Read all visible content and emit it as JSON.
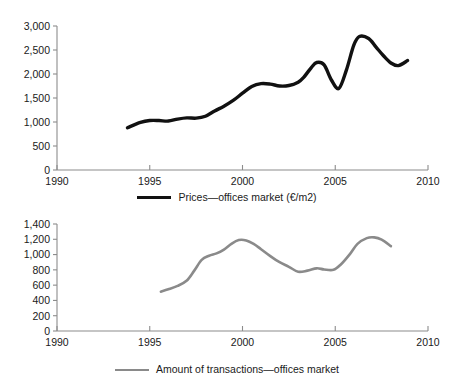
{
  "figure": {
    "background": "#ffffff",
    "panels": [
      "prices",
      "transactions"
    ]
  },
  "panel_prices": {
    "legend_label": "Prices—offices market (€/m2)",
    "legend_icon": "line-swatch-black",
    "line_color": "#111111",
    "axis_color": "#8c8c8c"
  },
  "panel_transactions": {
    "legend_label": "Amount of transactions—offices market",
    "legend_icon": "line-swatch-gray",
    "line_color": "#8a8a8a",
    "axis_color": "#8c8c8c"
  },
  "chart_data": [
    {
      "type": "line",
      "id": "prices-offices-market",
      "title": "",
      "xlabel": "",
      "ylabel": "",
      "xlim": [
        1990,
        2010
      ],
      "ylim": [
        0,
        3000
      ],
      "grid": false,
      "legend_position": "bottom",
      "xticks": [
        1990,
        1995,
        2000,
        2005,
        2010
      ],
      "xtick_labels": [
        "1990",
        "1995",
        "2000",
        "2005",
        "2010"
      ],
      "yticks": [
        0,
        500,
        1000,
        1500,
        2000,
        2500,
        3000
      ],
      "ytick_labels": [
        "0",
        "500",
        "1,000",
        "1,500",
        "2,000",
        "2,500",
        "3,000"
      ],
      "series": [
        {
          "name": "Prices—offices market (€/m2)",
          "color": "#111111",
          "x": [
            1993.8,
            1994.5,
            1995.0,
            1995.5,
            1996.0,
            1996.5,
            1997.0,
            1997.5,
            1998.0,
            1998.5,
            1999.0,
            1999.5,
            2000.0,
            2000.5,
            2001.0,
            2001.5,
            2002.0,
            2002.5,
            2003.0,
            2003.3,
            2003.7,
            2004.0,
            2004.4,
            2004.8,
            2005.2,
            2005.6,
            2006.0,
            2006.3,
            2006.8,
            2007.2,
            2007.6,
            2008.0,
            2008.4,
            2008.9
          ],
          "y": [
            880,
            990,
            1030,
            1030,
            1020,
            1060,
            1085,
            1080,
            1120,
            1230,
            1330,
            1450,
            1600,
            1740,
            1800,
            1790,
            1750,
            1760,
            1830,
            1930,
            2130,
            2240,
            2190,
            1870,
            1700,
            2080,
            2600,
            2780,
            2740,
            2560,
            2380,
            2230,
            2175,
            2280
          ]
        }
      ]
    },
    {
      "type": "line",
      "id": "amount-of-transactions-offices-market",
      "title": "",
      "xlabel": "",
      "ylabel": "",
      "xlim": [
        1990,
        2010
      ],
      "ylim": [
        0,
        1400
      ],
      "grid": false,
      "legend_position": "bottom",
      "xticks": [
        1990,
        1995,
        2000,
        2005,
        2010
      ],
      "xtick_labels": [
        "1990",
        "1995",
        "2000",
        "2005",
        "2010"
      ],
      "yticks": [
        0,
        200,
        400,
        600,
        800,
        1000,
        1200,
        1400
      ],
      "ytick_labels": [
        "0",
        "200",
        "400",
        "600",
        "800",
        "1,000",
        "1,200",
        "1,400"
      ],
      "series": [
        {
          "name": "Amount of transactions—offices market",
          "color": "#8a8a8a",
          "x": [
            1995.6,
            1996.0,
            1996.5,
            1997.0,
            1997.4,
            1997.8,
            1998.2,
            1998.6,
            1999.0,
            1999.4,
            1999.8,
            2000.2,
            2000.6,
            2001.0,
            2001.5,
            2002.0,
            2002.5,
            2003.0,
            2003.5,
            2004.0,
            2004.4,
            2004.9,
            2005.3,
            2005.8,
            2006.2,
            2006.7,
            2007.1,
            2007.5,
            2008.0
          ],
          "y": [
            515,
            545,
            590,
            660,
            790,
            930,
            985,
            1015,
            1065,
            1140,
            1190,
            1185,
            1140,
            1070,
            980,
            900,
            840,
            775,
            790,
            820,
            805,
            800,
            870,
            1010,
            1140,
            1215,
            1225,
            1195,
            1110
          ]
        }
      ]
    }
  ]
}
